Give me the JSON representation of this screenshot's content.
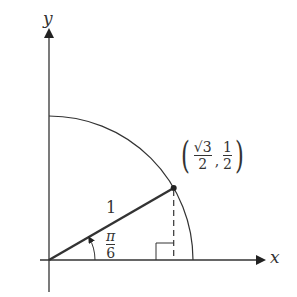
{
  "axes": {
    "x_label": "x",
    "y_label": "y"
  },
  "figure": {
    "radius_label": "1",
    "angle_label": {
      "numerator": "π",
      "denominator": "6"
    },
    "point_label": {
      "x": {
        "numerator": "√3",
        "denominator": "2"
      },
      "y": {
        "numerator": "1",
        "denominator": "2"
      },
      "open": "(",
      "close": ")",
      "separator": ","
    }
  },
  "colors": {
    "line": "#333333",
    "background": "#ffffff"
  }
}
